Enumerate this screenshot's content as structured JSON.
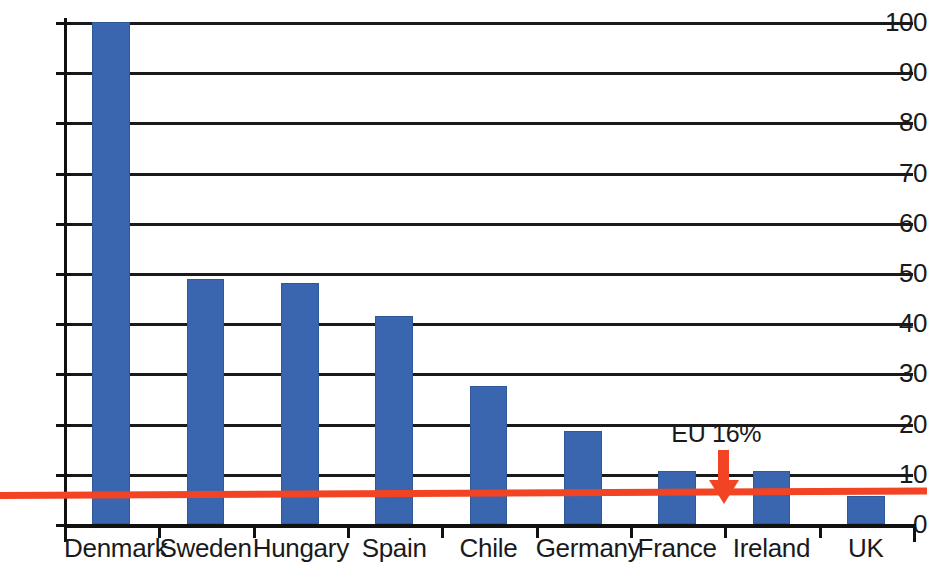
{
  "chart_data": {
    "type": "bar",
    "title": "",
    "subtitle": "",
    "xlabel": "",
    "ylabel": "",
    "categories": [
      "Denmark",
      "Sweden",
      "Hungary",
      "Spain",
      "Chile",
      "Germany",
      "France",
      "Ireland",
      "UK"
    ],
    "values": [
      100,
      48.8,
      48.0,
      41.4,
      27.5,
      18.5,
      10.5,
      10.5,
      5.6
    ],
    "series": [
      {
        "name": "",
        "values": [
          100,
          48.8,
          48.0,
          41.4,
          27.5,
          18.5,
          10.5,
          10.5,
          5.6
        ]
      }
    ],
    "ylim": [
      0,
      100
    ],
    "xlim": [
      0,
      9
    ],
    "y_ticks": [
      0,
      10,
      20,
      30,
      40,
      50,
      60,
      70,
      80,
      90,
      100
    ],
    "y_tick_labels": [
      "0",
      "10",
      "20",
      "30",
      "40",
      "50",
      "60",
      "70",
      "80",
      "90",
      "100"
    ],
    "grid": true,
    "grid_axis": "y",
    "legend": false,
    "legend_position": "none",
    "bar_color": "#3966ae",
    "grid_color": "#1a1a1a",
    "axis_color": "#111111",
    "background_color": "#ffffff",
    "annotations": [
      {
        "name": "eu-reference",
        "label": "EU 16%",
        "type": "hline-with-arrow",
        "value": 6,
        "color": "#f24425",
        "label_x_category": "France"
      }
    ]
  }
}
